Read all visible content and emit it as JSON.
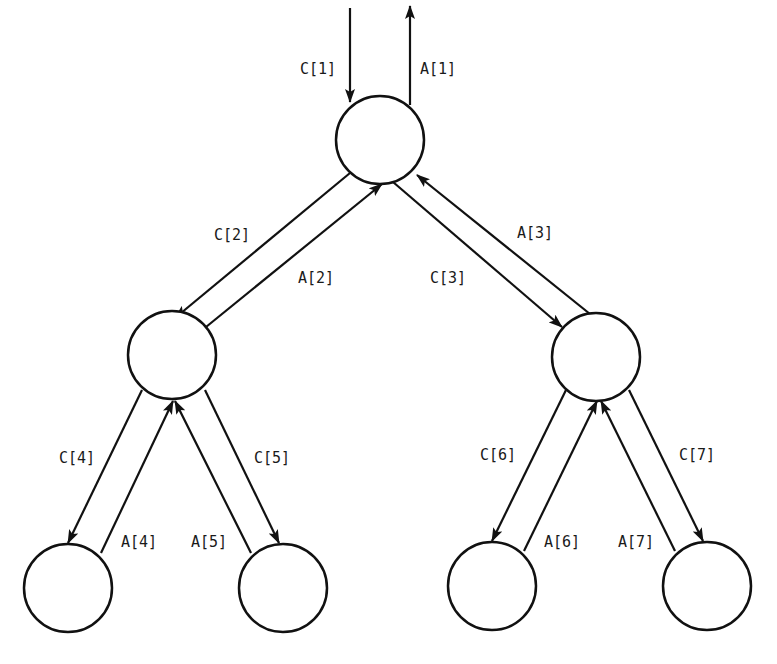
{
  "diagram": {
    "type": "binary-tree-message-passing",
    "nodes": [
      {
        "id": 1,
        "cx": 380,
        "cy": 140,
        "r": 44
      },
      {
        "id": 2,
        "cx": 172,
        "cy": 355,
        "r": 44
      },
      {
        "id": 3,
        "cx": 596,
        "cy": 357,
        "r": 44
      },
      {
        "id": 4,
        "cx": 68,
        "cy": 588,
        "r": 44
      },
      {
        "id": 5,
        "cx": 283,
        "cy": 588,
        "r": 44
      },
      {
        "id": 6,
        "cx": 492,
        "cy": 586,
        "r": 44
      },
      {
        "id": 7,
        "cx": 707,
        "cy": 586,
        "r": 44
      }
    ],
    "edges": [
      {
        "label": "C[1]",
        "direction": "down",
        "from": "input",
        "to": 1
      },
      {
        "label": "A[1]",
        "direction": "up",
        "from": 1,
        "to": "output"
      },
      {
        "label": "C[2]",
        "direction": "down",
        "from": 1,
        "to": 2
      },
      {
        "label": "A[2]",
        "direction": "up",
        "from": 2,
        "to": 1
      },
      {
        "label": "C[3]",
        "direction": "down",
        "from": 1,
        "to": 3
      },
      {
        "label": "A[3]",
        "direction": "up",
        "from": 3,
        "to": 1
      },
      {
        "label": "C[4]",
        "direction": "down",
        "from": 2,
        "to": 4
      },
      {
        "label": "A[4]",
        "direction": "up",
        "from": 4,
        "to": 2
      },
      {
        "label": "C[5]",
        "direction": "down",
        "from": 2,
        "to": 5
      },
      {
        "label": "A[5]",
        "direction": "up",
        "from": 5,
        "to": 2
      },
      {
        "label": "C[6]",
        "direction": "down",
        "from": 3,
        "to": 6
      },
      {
        "label": "A[6]",
        "direction": "up",
        "from": 6,
        "to": 3
      },
      {
        "label": "C[7]",
        "direction": "down",
        "from": 3,
        "to": 7
      },
      {
        "label": "A[7]",
        "direction": "up",
        "from": 7,
        "to": 3
      }
    ]
  },
  "labels": {
    "c1": "C[1]",
    "a1": "A[1]",
    "c2": "C[2]",
    "a2": "A[2]",
    "c3": "C[3]",
    "a3": "A[3]",
    "c4": "C[4]",
    "a4": "A[4]",
    "c5": "C[5]",
    "a5": "A[5]",
    "c6": "C[6]",
    "a6": "A[6]",
    "c7": "C[7]",
    "a7": "A[7]"
  },
  "colors": {
    "stroke": "#111111",
    "background": "#ffffff"
  }
}
